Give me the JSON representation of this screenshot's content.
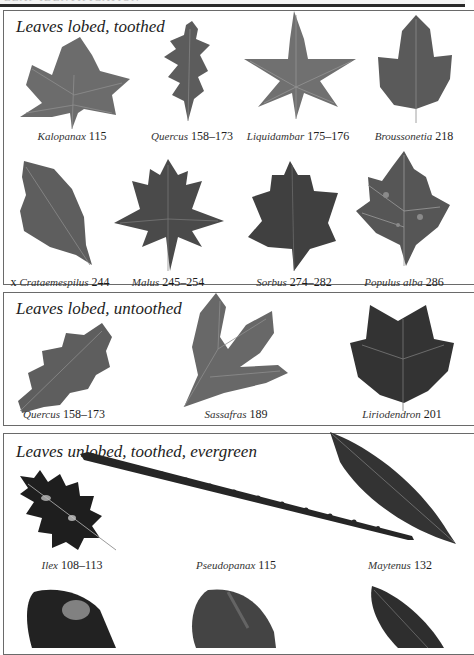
{
  "header": {
    "running_head": "LEAF IDENTIFICATION",
    "rule_color": "#2a2a2a"
  },
  "colors": {
    "leaf_mid_grey": "#6c6c6c",
    "leaf_dark_grey": "#3c3c3c",
    "leaf_black": "#1c1c1c",
    "panel_border": "#6a6a6a"
  },
  "sections": [
    {
      "title": "Leaves lobed, toothed",
      "items": [
        {
          "prefix": "",
          "genus": "Kalopanax",
          "pages": "115"
        },
        {
          "prefix": "",
          "genus": "Quercus",
          "pages": "158–173"
        },
        {
          "prefix": "",
          "genus": "Liquidambar",
          "pages": "175–176"
        },
        {
          "prefix": "",
          "genus": "Broussonetia",
          "pages": "218"
        },
        {
          "prefix": "x ",
          "genus": "Crataemespilus",
          "pages": "244"
        },
        {
          "prefix": "",
          "genus": "Malus",
          "pages": "245–254"
        },
        {
          "prefix": "",
          "genus": "Sorbus",
          "pages": "274–282"
        },
        {
          "prefix": "",
          "genus": "Populus alba",
          "pages": "286"
        }
      ]
    },
    {
      "title": "Leaves lobed, untoothed",
      "items": [
        {
          "prefix": "",
          "genus": "Quercus",
          "pages": "158–173"
        },
        {
          "prefix": "",
          "genus": "Sassafras",
          "pages": "189"
        },
        {
          "prefix": "",
          "genus": "Liriodendron",
          "pages": "201"
        }
      ]
    },
    {
      "title": "Leaves unlobed, toothed, evergreen",
      "items": [
        {
          "prefix": "",
          "genus": "Ilex",
          "pages": "108–113"
        },
        {
          "prefix": "",
          "genus": "Pseudopanax",
          "pages": "115"
        },
        {
          "prefix": "",
          "genus": "Maytenus",
          "pages": "132"
        }
      ]
    }
  ]
}
